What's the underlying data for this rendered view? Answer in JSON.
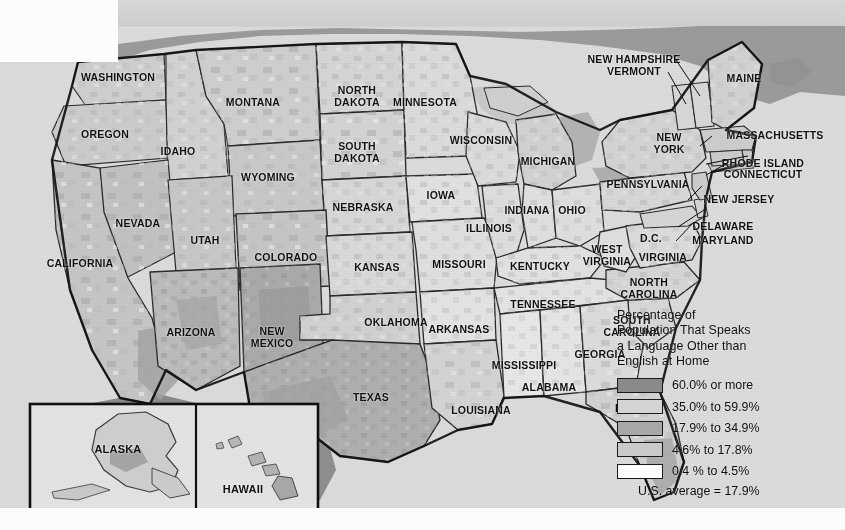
{
  "map": {
    "title_present": false,
    "background_color": "#ffffff",
    "ocean_color": "#d8d8d8",
    "canada_color": "#9a9a9a",
    "mexico_color": "#939393",
    "border_color": "#111111"
  },
  "legend": {
    "title_lines": [
      "Percentage of",
      "Population That Speaks",
      "a Language Other than",
      "English at Home"
    ],
    "classes": [
      {
        "label": "60.0% or more",
        "color": "#8c8c8c"
      },
      {
        "label": "35.0% to 59.9%",
        "color": "#d6d6d6"
      },
      {
        "label": "17.9% to 34.9%",
        "color": "#a9a9a9"
      },
      {
        "label": "4.6% to 17.8%",
        "color": "#cccccc"
      },
      {
        "label": "0.4 % to 4.5%",
        "color": "#ffffff"
      }
    ],
    "average_note": "U.S. average = 17.9%"
  },
  "inset": {
    "alaska_label": "ALASKA",
    "hawaii_label": "HAWAII"
  },
  "state_labels": [
    {
      "id": "washington",
      "text": "WASHINGTON",
      "x": 118,
      "y": 78
    },
    {
      "id": "oregon",
      "text": "OREGON",
      "x": 105,
      "y": 135
    },
    {
      "id": "idaho",
      "text": "IDAHO",
      "x": 178,
      "y": 152
    },
    {
      "id": "montana",
      "text": "MONTANA",
      "x": 253,
      "y": 103
    },
    {
      "id": "wyoming",
      "text": "WYOMING",
      "x": 268,
      "y": 178
    },
    {
      "id": "nevada",
      "text": "NEVADA",
      "x": 138,
      "y": 224
    },
    {
      "id": "utah",
      "text": "UTAH",
      "x": 205,
      "y": 241
    },
    {
      "id": "california",
      "text": "CALIFORNIA",
      "x": 80,
      "y": 264
    },
    {
      "id": "arizona",
      "text": "ARIZONA",
      "x": 191,
      "y": 333
    },
    {
      "id": "new-mexico",
      "text": "NEW\nMEXICO",
      "x": 272,
      "y": 337
    },
    {
      "id": "colorado",
      "text": "COLORADO",
      "x": 286,
      "y": 258
    },
    {
      "id": "north-dakota",
      "text": "NORTH\nDAKOTA",
      "x": 357,
      "y": 96
    },
    {
      "id": "south-dakota",
      "text": "SOUTH\nDAKOTA",
      "x": 357,
      "y": 152
    },
    {
      "id": "nebraska",
      "text": "NEBRASKA",
      "x": 363,
      "y": 208
    },
    {
      "id": "kansas",
      "text": "KANSAS",
      "x": 377,
      "y": 268
    },
    {
      "id": "oklahoma",
      "text": "OKLAHOMA",
      "x": 396,
      "y": 323
    },
    {
      "id": "texas",
      "text": "TEXAS",
      "x": 371,
      "y": 398
    },
    {
      "id": "minnesota",
      "text": "MINNESOTA",
      "x": 425,
      "y": 103
    },
    {
      "id": "iowa",
      "text": "IOWA",
      "x": 441,
      "y": 196
    },
    {
      "id": "missouri",
      "text": "MISSOURI",
      "x": 459,
      "y": 265
    },
    {
      "id": "arkansas",
      "text": "ARKANSAS",
      "x": 459,
      "y": 330
    },
    {
      "id": "louisiana",
      "text": "LOUISIANA",
      "x": 481,
      "y": 411
    },
    {
      "id": "wisconsin",
      "text": "WISCONSIN",
      "x": 481,
      "y": 141
    },
    {
      "id": "illinois",
      "text": "ILLINOIS",
      "x": 489,
      "y": 229
    },
    {
      "id": "michigan",
      "text": "MICHIGAN",
      "x": 548,
      "y": 162
    },
    {
      "id": "indiana",
      "text": "INDIANA",
      "x": 527,
      "y": 211
    },
    {
      "id": "ohio",
      "text": "OHIO",
      "x": 572,
      "y": 211
    },
    {
      "id": "kentucky",
      "text": "KENTUCKY",
      "x": 540,
      "y": 267
    },
    {
      "id": "tennessee",
      "text": "TENNESSEE",
      "x": 543,
      "y": 305
    },
    {
      "id": "mississippi",
      "text": "MISSISSIPPI",
      "x": 524,
      "y": 366
    },
    {
      "id": "alabama",
      "text": "ALABAMA",
      "x": 549,
      "y": 388
    },
    {
      "id": "georgia",
      "text": "GEORGIA",
      "x": 600,
      "y": 355
    },
    {
      "id": "florida",
      "text": "FLORIDA",
      "x": 639,
      "y": 409
    },
    {
      "id": "south-carolina",
      "text": "SOUTH\nCAROLINA",
      "x": 632,
      "y": 326
    },
    {
      "id": "north-carolina",
      "text": "NORTH\nCAROLINA",
      "x": 649,
      "y": 288
    },
    {
      "id": "west-virginia",
      "text": "WEST\nVIRGINIA",
      "x": 607,
      "y": 255
    },
    {
      "id": "virginia",
      "text": "VIRGINIA",
      "x": 663,
      "y": 258
    },
    {
      "id": "dc",
      "text": "D.C.",
      "x": 651,
      "y": 239
    },
    {
      "id": "maryland",
      "text": "MARYLAND",
      "x": 723,
      "y": 241
    },
    {
      "id": "delaware",
      "text": "DELAWARE",
      "x": 723,
      "y": 227
    },
    {
      "id": "new-jersey",
      "text": "NEW JERSEY",
      "x": 739,
      "y": 200
    },
    {
      "id": "pennsylvania",
      "text": "PENNSYLVANIA",
      "x": 648,
      "y": 185
    },
    {
      "id": "new-york",
      "text": "NEW\nYORK",
      "x": 669,
      "y": 143
    },
    {
      "id": "massachusetts",
      "text": "MASSACHUSETTS",
      "x": 775,
      "y": 136
    },
    {
      "id": "rhode-island",
      "text": "RHODE ISLAND",
      "x": 763,
      "y": 164
    },
    {
      "id": "connecticut",
      "text": "CONNECTICUT",
      "x": 763,
      "y": 175
    },
    {
      "id": "maine",
      "text": "MAINE",
      "x": 744,
      "y": 79
    },
    {
      "id": "new-hampshire",
      "text": "NEW HAMPSHIRE",
      "x": 634,
      "y": 60
    },
    {
      "id": "vermont",
      "text": "VERMONT",
      "x": 634,
      "y": 72
    }
  ]
}
